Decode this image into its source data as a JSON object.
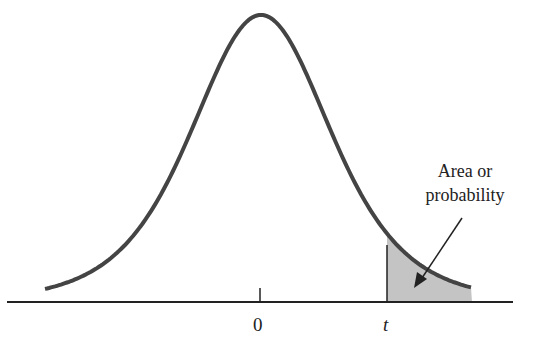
{
  "diagram": {
    "type": "t-distribution",
    "x_axis_labels": {
      "center": "0",
      "critical": "t"
    },
    "annotation": {
      "line1": "Area or",
      "line2": "probability"
    },
    "colors": {
      "curve": "#444444",
      "shade": "#c4c4c4",
      "axis": "#222222"
    }
  }
}
